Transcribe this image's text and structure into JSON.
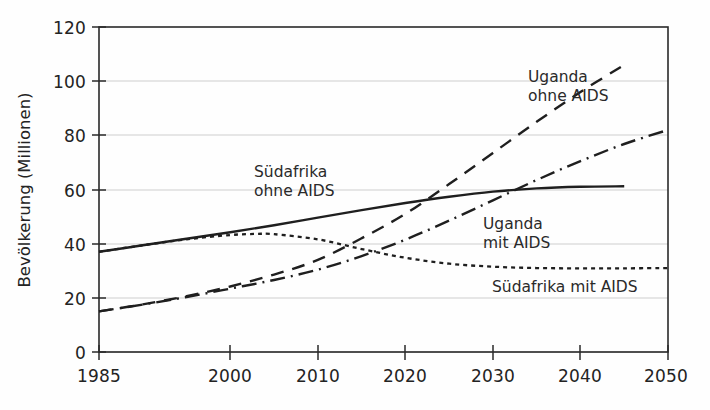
{
  "chart_data": {
    "type": "line",
    "title": "",
    "xlabel": "",
    "ylabel": "Bevölkerung (Millionen)",
    "xlim": [
      1985,
      2050
    ],
    "ylim": [
      0,
      120
    ],
    "grid": true,
    "legend_position": "inline-annotations",
    "x_ticks": [
      "1985",
      "2000",
      "2010",
      "2020",
      "2030",
      "2040",
      "2050"
    ],
    "x_tick_values": [
      1985,
      2000,
      2010,
      2020,
      2030,
      2040,
      2050
    ],
    "y_ticks": [
      "0",
      "20",
      "40",
      "60",
      "80",
      "100",
      "120"
    ],
    "y_tick_values": [
      0,
      20,
      40,
      60,
      80,
      100,
      120
    ],
    "series": [
      {
        "name": "Südafrika ohne AIDS",
        "style": "solid",
        "color": "#1f1f1f",
        "x": [
          1985,
          1990,
          1995,
          2000,
          2005,
          2010,
          2015,
          2020,
          2025,
          2030,
          2035,
          2040,
          2045
        ],
        "values": [
          37,
          39.4,
          41.8,
          44.2,
          46.8,
          49.6,
          52.4,
          55.0,
          57.3,
          59.2,
          60.4,
          61.0,
          61.2
        ]
      },
      {
        "name": "Südafrika mit AIDS",
        "style": "dotted",
        "color": "#1f1f1f",
        "x": [
          1985,
          1990,
          1995,
          2000,
          2003,
          2005,
          2010,
          2015,
          2020,
          2025,
          2030,
          2035,
          2040,
          2045,
          2050
        ],
        "values": [
          37,
          39.4,
          41.6,
          43.2,
          43.6,
          43.5,
          41.6,
          38.0,
          34.8,
          32.6,
          31.5,
          31.0,
          30.9,
          30.9,
          31.0
        ]
      },
      {
        "name": "Uganda ohne AIDS",
        "style": "dashed",
        "color": "#1f1f1f",
        "x": [
          1985,
          1990,
          1995,
          2000,
          2005,
          2010,
          2015,
          2020,
          2025,
          2030,
          2035,
          2040,
          2045
        ],
        "values": [
          15,
          17.6,
          20.6,
          24.2,
          28.6,
          34.0,
          42.0,
          51.0,
          62.0,
          73.5,
          85.0,
          96.0,
          106.0
        ]
      },
      {
        "name": "Uganda mit AIDS",
        "style": "dashdot",
        "color": "#1f1f1f",
        "x": [
          1985,
          1990,
          1995,
          2000,
          2005,
          2010,
          2015,
          2020,
          2025,
          2030,
          2035,
          2040,
          2045,
          2050
        ],
        "values": [
          15,
          17.5,
          20.3,
          23.4,
          26.6,
          30.4,
          35.4,
          41.5,
          48.5,
          56.0,
          63.5,
          70.5,
          76.8,
          82.0
        ]
      }
    ],
    "annotations": [
      {
        "id": "label-suedafrika-ohne-aids",
        "line1": "Südafrika",
        "line2": "ohne AIDS"
      },
      {
        "id": "label-uganda-ohne-aids",
        "line1": "Uganda",
        "line2": "ohne AIDS"
      },
      {
        "id": "label-uganda-mit-aids",
        "line1": "Uganda",
        "line2": "mit AIDS"
      },
      {
        "id": "label-suedafrika-mit-aids",
        "line1": "Südafrika mit AIDS",
        "line2": ""
      }
    ]
  },
  "axes": {
    "y_title": "Bevölkerung (Millionen)",
    "y_labels": {
      "t0": "0",
      "t20": "20",
      "t40": "40",
      "t60": "60",
      "t80": "80",
      "t100": "100",
      "t120": "120"
    },
    "x_labels": {
      "t1985": "1985",
      "t2000": "2000",
      "t2010": "2010",
      "t2020": "2020",
      "t2030": "2030",
      "t2040": "2040",
      "t2050": "2050"
    }
  },
  "annotations": {
    "sa_ohne_l1": "Südafrika",
    "sa_ohne_l2": "ohne AIDS",
    "ug_ohne_l1": "Uganda",
    "ug_ohne_l2": "ohne AIDS",
    "ug_mit_l1": "Uganda",
    "ug_mit_l2": "mit AIDS",
    "sa_mit_l1": "Südafrika mit AIDS"
  },
  "colors": {
    "ink": "#1f1f1f",
    "grid": "#c9c9c9",
    "frame": "#2a2a2a",
    "background": "#fefefe"
  }
}
